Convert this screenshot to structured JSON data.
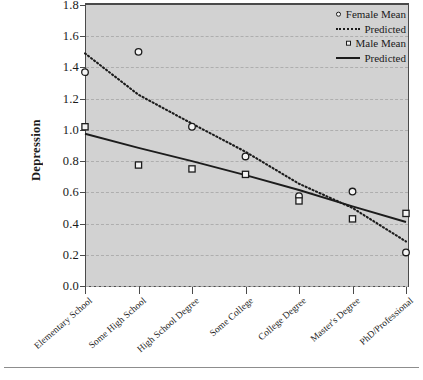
{
  "chart_data": {
    "type": "scatter",
    "title": "",
    "xlabel": "",
    "ylabel": "Depression",
    "ylim": [
      0.0,
      1.8
    ],
    "ytick_step": 0.2,
    "yticks": [
      "1.8",
      "1.6",
      "1.4",
      "1.2",
      "1.0",
      "0.8",
      "0.6",
      "0.4",
      "0.2",
      "0.0"
    ],
    "ytick_values": [
      1.8,
      1.6,
      1.4,
      1.2,
      1.0,
      0.8,
      0.6,
      0.4,
      0.2,
      0.0
    ],
    "grid": true,
    "grid_style": "dashed-horizontal",
    "legend_position": "top-right",
    "plot_background": "#d2d2d2",
    "categories": [
      "Elementary School",
      "Some High School",
      "High School Degree",
      "Some College",
      "College Degree",
      "Master's Degree",
      "PhD/Professional"
    ],
    "series": [
      {
        "name": "Female Mean",
        "type": "scatter",
        "marker": "open-circle",
        "color": "#1c1c1c",
        "values": [
          1.37,
          1.5,
          1.02,
          0.83,
          0.575,
          0.605,
          0.215
        ]
      },
      {
        "name": "Predicted",
        "type": "line",
        "line_style": "dotted",
        "color": "#1c1c1c",
        "group": "Female",
        "values": [
          1.49,
          1.225,
          1.04,
          0.86,
          0.655,
          0.5,
          0.285
        ]
      },
      {
        "name": "Male Mean",
        "type": "scatter",
        "marker": "open-square",
        "color": "#1c1c1c",
        "values": [
          1.02,
          0.775,
          0.75,
          0.715,
          0.545,
          0.43,
          0.465
        ]
      },
      {
        "name": "Predicted",
        "type": "line",
        "line_style": "solid",
        "color": "#1c1c1c",
        "group": "Male",
        "values": [
          0.975,
          0.885,
          0.8,
          0.71,
          0.615,
          0.51,
          0.41
        ]
      }
    ]
  },
  "legend": {
    "items": [
      {
        "label": "Female Mean",
        "key": "open-circle"
      },
      {
        "label": "Predicted",
        "key": "dotted-line"
      },
      {
        "label": "Male Mean",
        "key": "open-square"
      },
      {
        "label": "Predicted",
        "key": "solid-line"
      }
    ]
  },
  "axes": {
    "y_title": "Depression"
  }
}
